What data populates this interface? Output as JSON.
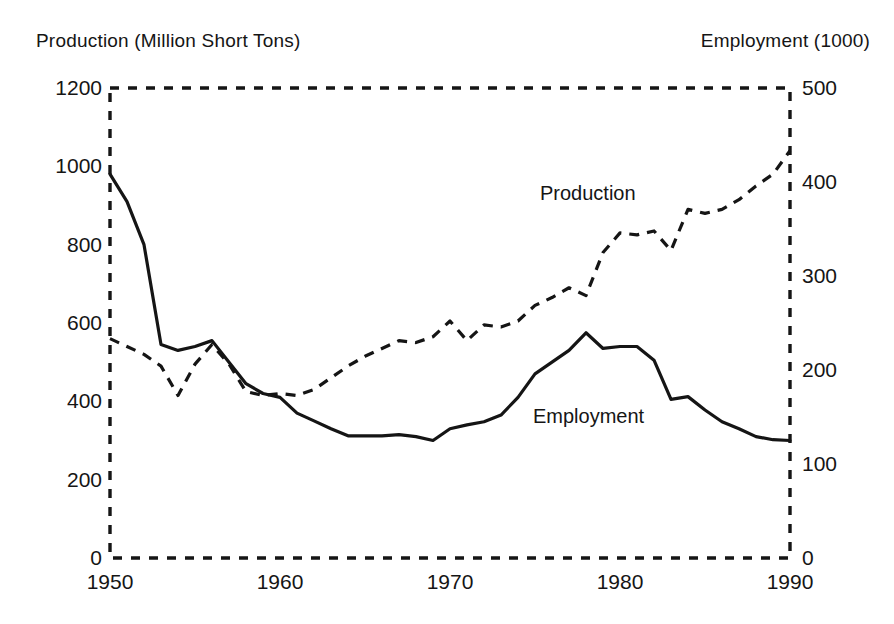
{
  "axes": {
    "left_title": "Production (Million Short Tons)",
    "right_title": "Employment (1000)",
    "left_ticks": [
      "1200",
      "1000",
      "800",
      "600",
      "400",
      "200",
      "0"
    ],
    "right_ticks": [
      "500",
      "400",
      "300",
      "200",
      "100",
      "0"
    ],
    "x_ticks": [
      "1950",
      "1960",
      "1970",
      "1980",
      "1990"
    ]
  },
  "series_labels": {
    "production": "Production",
    "employment": "Employment"
  },
  "colors": {
    "ink": "#151515",
    "frame": "#151515"
  },
  "chart_data": {
    "type": "line",
    "title": "",
    "subtitle": "",
    "xlabel": "",
    "ylabel": "Production (Million Short Tons)",
    "y2label": "Employment (1000)",
    "xlim": [
      1950,
      1990
    ],
    "ylim": [
      0,
      1200
    ],
    "y2lim": [
      0,
      500
    ],
    "xticks": [
      1950,
      1960,
      1970,
      1980,
      1990
    ],
    "yticks": [
      0,
      200,
      400,
      600,
      800,
      1000,
      1200
    ],
    "y2ticks": [
      0,
      100,
      200,
      300,
      400,
      500
    ],
    "grid": false,
    "frame": "dashed",
    "legend": "inline-annotations",
    "x": [
      1950,
      1951,
      1952,
      1953,
      1954,
      1955,
      1956,
      1957,
      1958,
      1959,
      1960,
      1961,
      1962,
      1963,
      1964,
      1965,
      1966,
      1967,
      1968,
      1969,
      1970,
      1971,
      1972,
      1973,
      1974,
      1975,
      1976,
      1977,
      1978,
      1979,
      1980,
      1981,
      1982,
      1983,
      1984,
      1985,
      1986,
      1987,
      1988,
      1989,
      1990
    ],
    "series": [
      {
        "name": "Production",
        "axis": "left",
        "units": "Million Short Tons",
        "style": "dashed",
        "values": [
          560,
          540,
          520,
          490,
          415,
          495,
          545,
          495,
          425,
          415,
          420,
          415,
          430,
          460,
          490,
          515,
          535,
          555,
          550,
          565,
          605,
          555,
          595,
          590,
          605,
          645,
          665,
          690,
          670,
          780,
          830,
          825,
          835,
          785,
          890,
          880,
          890,
          915,
          950,
          980,
          1040
        ]
      },
      {
        "name": "Employment",
        "axis": "right",
        "units": "1000 workers",
        "style": "solid",
        "values": [
          415,
          390,
          340,
          235,
          228,
          230,
          235,
          215,
          190,
          180,
          175,
          158,
          150,
          140,
          132,
          133,
          133,
          134,
          132,
          128,
          140,
          145,
          148,
          155,
          175,
          200,
          212,
          225,
          240,
          228,
          230,
          230,
          215,
          172,
          175,
          160,
          148,
          140,
          132,
          128,
          127
        ],
        "values_on_left_scale": [
          980,
          910,
          800,
          545,
          530,
          540,
          555,
          500,
          445,
          420,
          410,
          370,
          350,
          330,
          312,
          312,
          312,
          315,
          310,
          300,
          330,
          340,
          348,
          365,
          410,
          470,
          500,
          530,
          575,
          535,
          540,
          540,
          505,
          405,
          412,
          378,
          348,
          330,
          310,
          302,
          300
        ]
      }
    ],
    "annotations": [
      {
        "text": "Production",
        "x": 1975,
        "y_left": 760
      },
      {
        "text": "Employment",
        "x": 1974,
        "y_left": 330
      }
    ]
  }
}
